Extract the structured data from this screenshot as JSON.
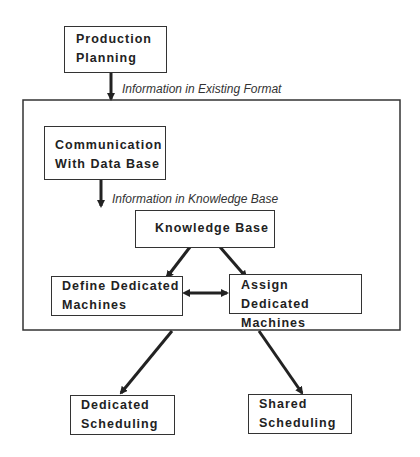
{
  "nodes": {
    "production_planning": {
      "line1": "Production",
      "line2": "Planning"
    },
    "communication": {
      "line1": "Communication",
      "line2": "With Data Base"
    },
    "knowledge_base": {
      "label": "Knowledge Base"
    },
    "define": {
      "line1": "Define Dedicated",
      "line2": "Machines"
    },
    "assign": {
      "line1": "Assign Dedicated",
      "line2": "Machines"
    },
    "dedicated": {
      "line1": "Dedicated",
      "line2": "Scheduling"
    },
    "shared": {
      "line1": "Shared",
      "line2": "Scheduling"
    }
  },
  "edges": {
    "existing_format": "Information in Existing Format",
    "kb_format_line1": "Information in Knowledge Base",
    "kb_format_line2": "Format"
  },
  "colors": {
    "stroke": "#333333",
    "background": "#ffffff"
  }
}
